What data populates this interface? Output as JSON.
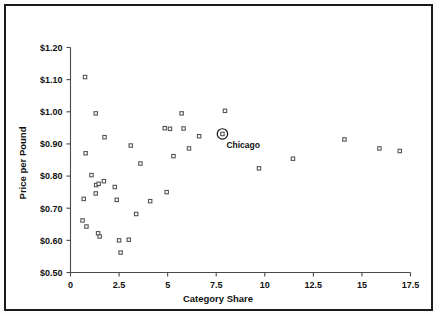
{
  "figure": {
    "border_color": "#1a1a1a",
    "background": "#ffffff",
    "axis_color": "#4a4a4a",
    "marker_color": "#555555",
    "annotation_color": "#111111"
  },
  "chart_data": {
    "type": "scatter",
    "title": "",
    "xlabel": "Category Share",
    "ylabel": "Price per Pound",
    "xlim": [
      0,
      17.5
    ],
    "ylim": [
      0.5,
      1.2
    ],
    "grid": false,
    "legend": null,
    "xticks": [
      0,
      2.5,
      5,
      7.5,
      10,
      12.5,
      15,
      17.5
    ],
    "xtick_labels": [
      "0",
      "2.5",
      "5",
      "7.5",
      "10",
      "12.5",
      "15",
      "17.5"
    ],
    "yticks": [
      0.5,
      0.6,
      0.7,
      0.8,
      0.9,
      1.0,
      1.1,
      1.2
    ],
    "ytick_labels": [
      "$0.50",
      "$0.60",
      "$0.70",
      "$0.80",
      "$0.90",
      "$1.00",
      "$1.10",
      "$1.20"
    ],
    "marker": "square-open",
    "points": [
      {
        "x": 0.75,
        "y": 1.108
      },
      {
        "x": 1.3,
        "y": 0.995
      },
      {
        "x": 1.75,
        "y": 0.921
      },
      {
        "x": 0.78,
        "y": 0.871
      },
      {
        "x": 1.08,
        "y": 0.803
      },
      {
        "x": 1.32,
        "y": 0.772
      },
      {
        "x": 1.45,
        "y": 0.776
      },
      {
        "x": 1.72,
        "y": 0.784
      },
      {
        "x": 1.3,
        "y": 0.746
      },
      {
        "x": 0.68,
        "y": 0.729
      },
      {
        "x": 0.62,
        "y": 0.662
      },
      {
        "x": 0.82,
        "y": 0.643
      },
      {
        "x": 1.42,
        "y": 0.622
      },
      {
        "x": 1.5,
        "y": 0.612
      },
      {
        "x": 2.28,
        "y": 0.766
      },
      {
        "x": 2.38,
        "y": 0.726
      },
      {
        "x": 2.5,
        "y": 0.6
      },
      {
        "x": 2.58,
        "y": 0.562
      },
      {
        "x": 3.0,
        "y": 0.602
      },
      {
        "x": 3.1,
        "y": 0.895
      },
      {
        "x": 3.38,
        "y": 0.682
      },
      {
        "x": 3.6,
        "y": 0.839
      },
      {
        "x": 4.1,
        "y": 0.722
      },
      {
        "x": 4.85,
        "y": 0.949
      },
      {
        "x": 5.12,
        "y": 0.947
      },
      {
        "x": 4.95,
        "y": 0.75
      },
      {
        "x": 5.3,
        "y": 0.862
      },
      {
        "x": 5.72,
        "y": 0.995
      },
      {
        "x": 5.82,
        "y": 0.948
      },
      {
        "x": 6.1,
        "y": 0.886
      },
      {
        "x": 6.62,
        "y": 0.924
      },
      {
        "x": 7.82,
        "y": 0.931,
        "label": "Chicago",
        "highlighted": true
      },
      {
        "x": 7.95,
        "y": 1.003
      },
      {
        "x": 9.7,
        "y": 0.824
      },
      {
        "x": 11.45,
        "y": 0.854
      },
      {
        "x": 14.1,
        "y": 0.914
      },
      {
        "x": 15.9,
        "y": 0.886
      },
      {
        "x": 16.95,
        "y": 0.878
      }
    ],
    "annotations": [
      {
        "text": "Chicago",
        "x": 7.82,
        "y": 0.931
      }
    ]
  }
}
